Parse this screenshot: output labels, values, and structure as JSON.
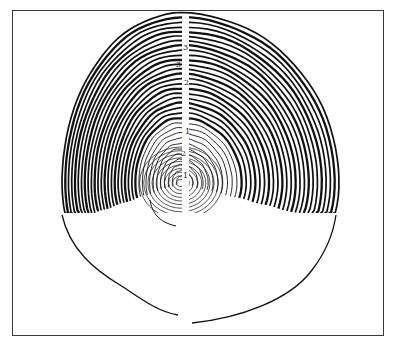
{
  "figure": {
    "frame": {
      "x": 12,
      "y": 10,
      "width": 372,
      "height": 326,
      "color": "#3a3a3a"
    },
    "pith": {
      "cx": 181,
      "cy": 183
    },
    "rings": {
      "count": 34,
      "cut_y": 213,
      "left_radius": 119,
      "right_radius": 158,
      "top_radius": 170,
      "inner_dense_radius": 40,
      "ink": "#111111"
    },
    "crack": {
      "x": 182,
      "width": 7,
      "top": 14,
      "bottom": 213
    },
    "outline_bottom_left": "M62,215 C70,250 95,270 120,285 C140,298 158,312 178,315",
    "outline_bottom_right": "M192,323 C240,318 290,300 312,270 C326,252 333,235 336,215",
    "inner_tail": "M150,200 C152,212 158,222 176,226",
    "labels": [
      {
        "text": "3",
        "x": 183,
        "y": 44
      },
      {
        "text": "3",
        "x": 176,
        "y": 61
      },
      {
        "text": "2",
        "x": 184,
        "y": 79
      },
      {
        "text": "1",
        "x": 185,
        "y": 128
      },
      {
        "text": "2",
        "x": 181,
        "y": 150
      },
      {
        "text": "1",
        "x": 183,
        "y": 172
      }
    ]
  }
}
